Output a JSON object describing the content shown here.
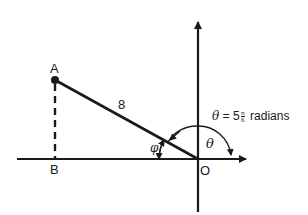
{
  "diagram": {
    "type": "angle-in-standard-position",
    "colors": {
      "ink": "#1a1a1a",
      "background": "#ffffff"
    },
    "points": {
      "A": {
        "label": "A"
      },
      "B": {
        "label": "B"
      },
      "O": {
        "label": "O"
      }
    },
    "segment_OA": {
      "length_label": "8"
    },
    "angles": {
      "phi": {
        "symbol": "φ"
      },
      "theta": {
        "symbol": "θ"
      }
    },
    "theta_annotation": {
      "symbol": "θ",
      "equals": "=",
      "coefficient": "5",
      "fraction_num": "π",
      "fraction_den": "6",
      "unit": "radians"
    }
  }
}
